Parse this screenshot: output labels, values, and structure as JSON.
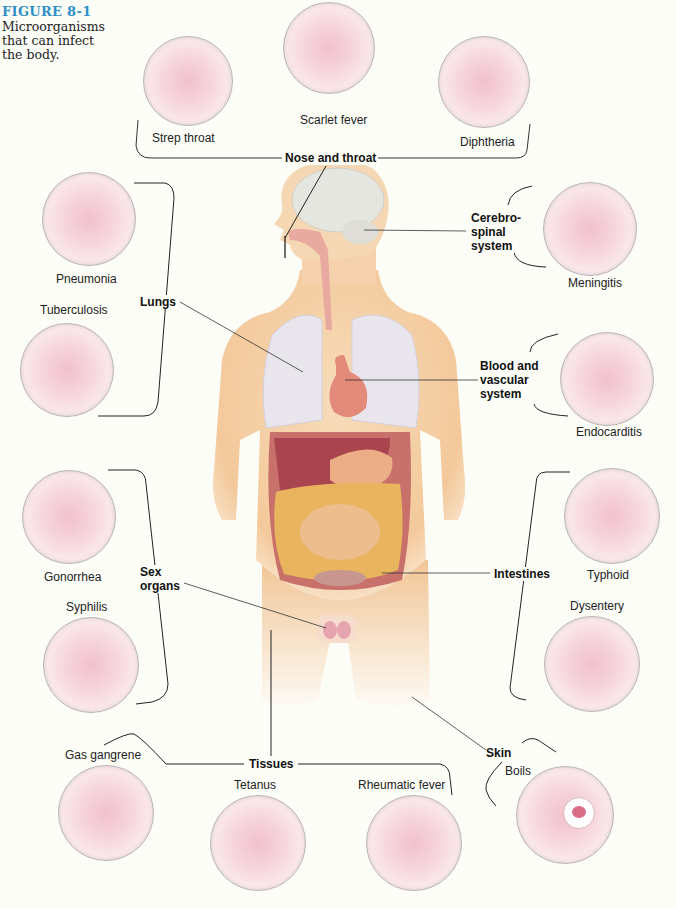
{
  "figure": {
    "number": "FIGURE 8-1",
    "caption": "Microorganisms that can infect the body."
  },
  "colors": {
    "title_blue": "#2e8fc6",
    "skin": "#f3c99b",
    "lung": "#e8e6ec",
    "brain": "#e6e6e0",
    "liver": "#b0505a",
    "intestine": "#e8b45c",
    "slide_pink": "#f2c1cc"
  },
  "systems": [
    {
      "id": "nose-throat",
      "label": "Nose and throat",
      "diseases": [
        "Strep throat",
        "Scarlet fever",
        "Diphtheria"
      ]
    },
    {
      "id": "lungs",
      "label": "Lungs",
      "diseases": [
        "Pneumonia",
        "Tuberculosis"
      ]
    },
    {
      "id": "cerebrospinal",
      "label": "Cerebro-\nspinal\nsystem",
      "label_lines": [
        "Cerebro-",
        "spinal",
        "system"
      ],
      "diseases": [
        "Meningitis"
      ]
    },
    {
      "id": "blood",
      "label": "Blood and vascular system",
      "label_lines": [
        "Blood and",
        "vascular",
        "system"
      ],
      "diseases": [
        "Endocarditis"
      ]
    },
    {
      "id": "sex-organs",
      "label": "Sex organs",
      "label_lines": [
        "Sex",
        "organs"
      ],
      "diseases": [
        "Gonorrhea",
        "Syphilis"
      ]
    },
    {
      "id": "intestines",
      "label": "Intestines",
      "diseases": [
        "Typhoid",
        "Dysentery"
      ]
    },
    {
      "id": "tissues",
      "label": "Tissues",
      "diseases": [
        "Gas gangrene",
        "Tetanus",
        "Rheumatic fever"
      ]
    },
    {
      "id": "skin",
      "label": "Skin",
      "diseases": [
        "Boils"
      ]
    }
  ]
}
